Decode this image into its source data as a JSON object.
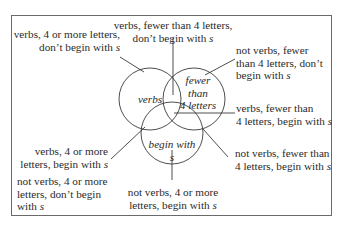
{
  "diagram": {
    "type": "venn",
    "sets": [
      {
        "id": "verbs",
        "label": "verbs"
      },
      {
        "id": "fewer",
        "label_lines": [
          "fewer",
          "than",
          "4 letters"
        ]
      },
      {
        "id": "begin",
        "label_lines": [
          "begin with",
          "s"
        ]
      }
    ],
    "regions": {
      "top": [
        "verbs, fewer than 4 letters,",
        "don’t begin with "
      ],
      "top_s": "s",
      "upper_left": [
        "verbs, 4 or more letters,",
        "don’t begin with "
      ],
      "upper_left_s": "s",
      "upper_right": [
        "not verbs, fewer",
        "than 4 letters, don’t",
        "begin with "
      ],
      "upper_right_s": "s",
      "mid_right": [
        "verbs, fewer than",
        "4 letters, begin with "
      ],
      "mid_right_s": "s",
      "lower_left": [
        "verbs, 4 or more",
        "letters, begin with "
      ],
      "lower_left_s": "s",
      "lower_right": [
        "not verbs, fewer than",
        "4 letters, begin with "
      ],
      "lower_right_s": "s",
      "outside": [
        "not verbs, 4 or more",
        "letters, don’t begin",
        "with "
      ],
      "outside_s": "s",
      "bottom": [
        "not verbs, 4 or more",
        "letters, begin with "
      ],
      "bottom_s": "s"
    }
  }
}
